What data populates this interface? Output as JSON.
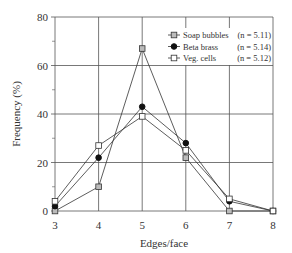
{
  "chart_data": {
    "type": "line",
    "title": "",
    "xlabel": "Edges/face",
    "ylabel": "Frequency (%)",
    "x": [
      3,
      4,
      5,
      6,
      7,
      8
    ],
    "xlim": [
      3,
      8
    ],
    "ylim": [
      0,
      80
    ],
    "xticks": [
      "3",
      "4",
      "5",
      "6",
      "7",
      "8"
    ],
    "yticks": [
      "0",
      "20",
      "40",
      "60",
      "80"
    ],
    "grid": true,
    "legend_position": "upper right",
    "series": [
      {
        "name": "Soap bubbles",
        "n_label": "(n = 5.11)",
        "marker": "square-gray",
        "values": [
          0,
          10,
          67,
          22,
          0,
          0
        ]
      },
      {
        "name": "Beta brass",
        "n_label": "(n = 5.14)",
        "marker": "circle-filled",
        "values": [
          2,
          22,
          43,
          28,
          4,
          0
        ]
      },
      {
        "name": "Veg. cells",
        "n_label": "(n = 5.12)",
        "marker": "square-open",
        "values": [
          4,
          27,
          39,
          25,
          5,
          0
        ]
      }
    ]
  },
  "colors": {
    "line": "#333333",
    "grid": "#555555",
    "marker_gray": "#bbbbbb",
    "marker_fill": "#111111"
  }
}
